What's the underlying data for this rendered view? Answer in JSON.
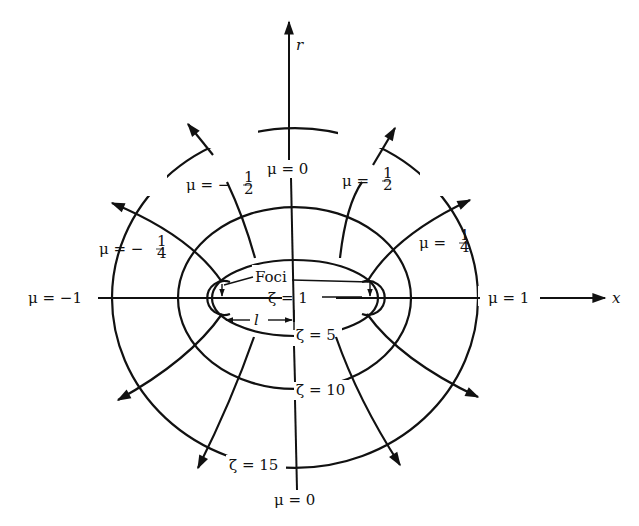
{
  "diagram": {
    "axes": {
      "horizontal": "x",
      "vertical": "r"
    },
    "ellipses": [
      {
        "label": "ζ = 1",
        "value": 1
      },
      {
        "label": "ζ = 5",
        "value": 5
      },
      {
        "label": "ζ = 10",
        "value": 10
      },
      {
        "label": "ζ = 15",
        "value": 15
      }
    ],
    "hyperbolas": [
      {
        "label": "μ = 1",
        "value": "1"
      },
      {
        "label": "μ = 1/4",
        "value": "1/4"
      },
      {
        "label": "μ = 1/2",
        "value": "1/2"
      },
      {
        "label": "μ = 0",
        "value": "0"
      },
      {
        "label": "μ = −1/2",
        "value": "-1/2"
      },
      {
        "label": "μ = −1/4",
        "value": "-1/4"
      },
      {
        "label": "μ = −1",
        "value": "-1"
      }
    ],
    "labels": {
      "r_axis": "r",
      "x_axis": "x",
      "mu_0_top": "μ = 0",
      "mu_0_bottom": "μ = 0",
      "mu_half_pos": "μ = ",
      "mu_half_neg": "μ = −",
      "mu_quarter_pos": "μ = ",
      "mu_quarter_neg": "μ = −",
      "frac_half_num": "1",
      "frac_half_den": "2",
      "frac_quarter_num": "1",
      "frac_quarter_den": "4",
      "mu_one_pos": "μ = 1",
      "mu_one_neg": "μ = −1",
      "zeta_1": "ζ = 1",
      "zeta_5": "ζ = 5",
      "zeta_10": "ζ = 10",
      "zeta_15": "ζ = 15",
      "foci": "Foci",
      "focal_length": "l"
    }
  }
}
